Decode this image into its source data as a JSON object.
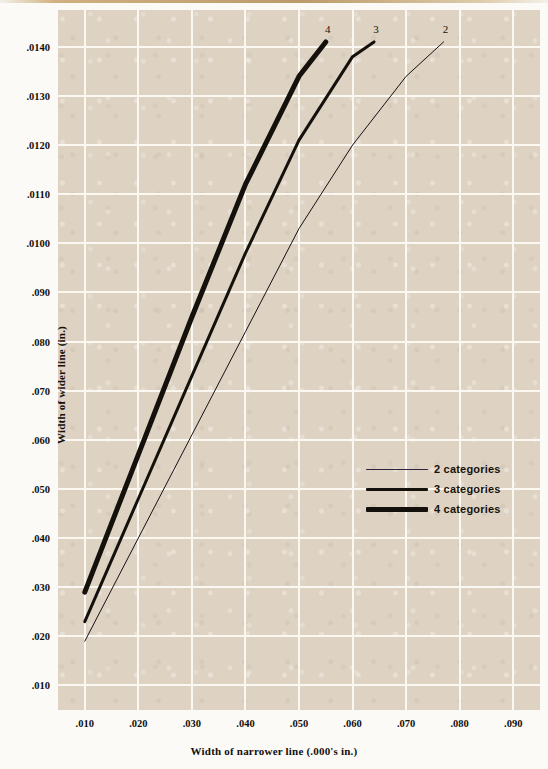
{
  "chart_data": {
    "type": "line",
    "title": "",
    "xlabel": "Width of narrower line (.000's in.)",
    "ylabel": "Width of wider line (in.)",
    "xlim": [
      0.005,
      0.095
    ],
    "ylim": [
      0.0005,
      0.01475
    ],
    "grid": true,
    "legend_position": "center-right",
    "x_ticks": [
      ".010",
      ".020",
      ".030",
      ".040",
      ".050",
      ".060",
      ".070",
      ".080",
      ".090"
    ],
    "x_tick_values": [
      0.01,
      0.02,
      0.03,
      0.04,
      0.05,
      0.06,
      0.07,
      0.08,
      0.09
    ],
    "y_ticks": [
      ".0140",
      ".0130",
      ".0120",
      ".0110",
      ".0100",
      ".090",
      ".080",
      ".070",
      ".060",
      ".050",
      ".040",
      ".030",
      ".020",
      ".010"
    ],
    "y_tick_values": [
      0.014,
      0.013,
      0.012,
      0.011,
      0.01,
      0.009,
      0.008,
      0.007,
      0.006,
      0.005,
      0.004,
      0.003,
      0.002,
      0.001
    ],
    "series": [
      {
        "name": "2 categories",
        "end_label": "2",
        "line_width": 1,
        "color": "#151015",
        "x": [
          0.01,
          0.02,
          0.03,
          0.04,
          0.05,
          0.06,
          0.07,
          0.077
        ],
        "y": [
          0.0019,
          0.004,
          0.0061,
          0.0082,
          0.0103,
          0.012,
          0.0134,
          0.0141
        ]
      },
      {
        "name": "3 categories",
        "end_label": "3",
        "line_width": 3,
        "color": "#14110c",
        "x": [
          0.01,
          0.02,
          0.03,
          0.04,
          0.05,
          0.06,
          0.064
        ],
        "y": [
          0.0023,
          0.0048,
          0.0073,
          0.0098,
          0.0121,
          0.0138,
          0.0141
        ]
      },
      {
        "name": "4 categories",
        "end_label": "4",
        "line_width": 5,
        "color": "#14110c",
        "x": [
          0.01,
          0.02,
          0.03,
          0.04,
          0.05,
          0.055
        ],
        "y": [
          0.0029,
          0.0057,
          0.0085,
          0.0112,
          0.0134,
          0.0141
        ]
      }
    ],
    "legend": [
      {
        "label": "2 categories",
        "line_width": 1,
        "color": "#2e2340"
      },
      {
        "label": "3 categories",
        "line_width": 3,
        "color": "#14110c"
      },
      {
        "label": "4 categories",
        "line_width": 5,
        "color": "#14110c"
      }
    ],
    "colors": {
      "plot_background": "#ded2c2",
      "gridline": "#fbf7f1",
      "page_background": "#fbfaf7",
      "text": "#12100c",
      "curve": "#14110c"
    }
  }
}
